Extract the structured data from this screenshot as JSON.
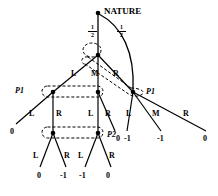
{
  "diagram": {
    "title": "NATURE",
    "type": "extensive-form-game-tree",
    "nature": {
      "label": "NATURE",
      "prob_left_num": "1",
      "prob_left_den": "2",
      "prob_right_num": "1",
      "prob_right_den": "2"
    },
    "players": {
      "p1_left": "P1",
      "p1_right": "P1",
      "p2": "P2"
    },
    "actions": {
      "node2_left": "L",
      "node2_mid": "M",
      "node2_right": "R",
      "left_p1_left": "L",
      "left_p1_right": "R",
      "mid_p1_left": "L",
      "mid_p1_right": "R",
      "right_p1_left": "L",
      "right_p1_mid": "M",
      "right_p1_right": "R",
      "p2a_left": "L",
      "p2a_right": "R",
      "p2b_left": "L",
      "p2b_right": "R"
    },
    "payoffs": {
      "left_outer": "0",
      "bottom_1": "0",
      "bottom_2": "-1",
      "bottom_3": "-1",
      "bottom_4": "0",
      "right_1": "0",
      "right_2": "-1",
      "right_3": "-1",
      "right_4": "0"
    },
    "colors": {
      "line": "#000000",
      "background": "#ffffff",
      "dashed": "#000000"
    }
  }
}
